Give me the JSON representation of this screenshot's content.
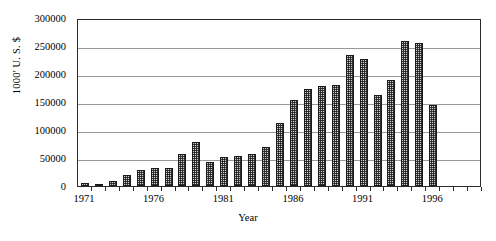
{
  "chart_data": {
    "type": "bar",
    "title": "",
    "xlabel": "Year",
    "ylabel": "1000' U. S. $",
    "ylim": [
      0,
      300000
    ],
    "ytick_step": 50000,
    "ytick_labels": [
      "300000",
      "250000",
      "200000",
      "150000",
      "100000",
      "50000",
      "0"
    ],
    "ytick_values": [
      300000,
      250000,
      200000,
      150000,
      100000,
      50000,
      0
    ],
    "xtick_labels": [
      "1971",
      "1976",
      "1981",
      "1986",
      "1991",
      "1996"
    ],
    "xtick_values": [
      1971,
      1976,
      1981,
      1986,
      1991,
      1996
    ],
    "grid": true,
    "legend": "none",
    "bar_fill": "#cfcfcf",
    "bar_edge": "#1a1a1a",
    "gridline_color": "#9a9a9a",
    "axis_color": "#2b2b2b",
    "categories": [
      "1971",
      "1972",
      "1973",
      "1974",
      "1975",
      "1976",
      "1977",
      "1978",
      "1979",
      "1980",
      "1981",
      "1982",
      "1983",
      "1984",
      "1985",
      "1986",
      "1987",
      "1988",
      "1989",
      "1990",
      "1991",
      "1992",
      "1993",
      "1994",
      "1995",
      "1996",
      "1997",
      "1998",
      "1999"
    ],
    "values": [
      6000,
      2000,
      9000,
      20000,
      28000,
      32000,
      33000,
      58000,
      79000,
      42000,
      51000,
      53000,
      57000,
      69000,
      112000,
      153000,
      173000,
      178000,
      180000,
      234000,
      227000,
      163000,
      190000,
      259000,
      255000,
      145000,
      0,
      0,
      0
    ],
    "series": [
      {
        "name": "Value",
        "values": [
          6000,
          2000,
          9000,
          20000,
          28000,
          32000,
          33000,
          58000,
          79000,
          42000,
          51000,
          53000,
          57000,
          69000,
          112000,
          153000,
          173000,
          178000,
          180000,
          234000,
          227000,
          163000,
          190000,
          259000,
          255000,
          145000,
          0,
          0,
          0
        ]
      }
    ]
  }
}
